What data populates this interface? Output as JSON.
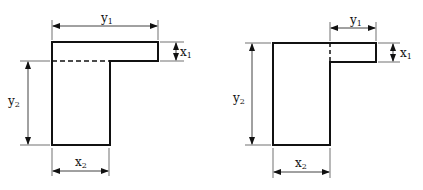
{
  "figures": [
    {
      "id": "left",
      "labels": {
        "y1": "y",
        "y1_sub": "1",
        "x1": "x",
        "x1_sub": "1",
        "y2": "y",
        "y2_sub": "2",
        "x2": "x",
        "x2_sub": "2"
      },
      "note": "dashed horizontal division line between flange and stem"
    },
    {
      "id": "right",
      "labels": {
        "y1": "y",
        "y1_sub": "1",
        "x1": "x",
        "x1_sub": "1",
        "y2": "y",
        "y2_sub": "2",
        "x2": "x",
        "x2_sub": "2"
      },
      "note": "dashed vertical division line between stem and flange"
    }
  ],
  "colors": {
    "stroke": "#111111",
    "background": "#ffffff"
  }
}
